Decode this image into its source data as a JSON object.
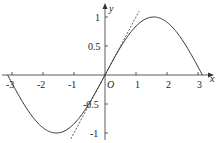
{
  "chart_data": {
    "type": "line",
    "title": "",
    "xlabel": "x",
    "ylabel": "y",
    "origin_label": "O",
    "xlim": [
      -3.3,
      3.6
    ],
    "ylim": [
      -1.15,
      1.2
    ],
    "x_ticks": [
      "-3",
      "-2",
      "-1",
      "1",
      "2",
      "3"
    ],
    "y_ticks": [
      "1",
      "0.5",
      "-0.5",
      "-1"
    ],
    "grid": false,
    "series": [
      {
        "name": "y = sin x",
        "style": "solid",
        "x": [
          -3.14,
          -1.57,
          0,
          1.57,
          3.14
        ],
        "y": [
          0,
          -1,
          0,
          1,
          0
        ]
      },
      {
        "name": "y = x (tangent at origin)",
        "style": "dashed",
        "x": [
          -1.1,
          1.1
        ],
        "y": [
          -1.1,
          1.1
        ]
      }
    ]
  }
}
